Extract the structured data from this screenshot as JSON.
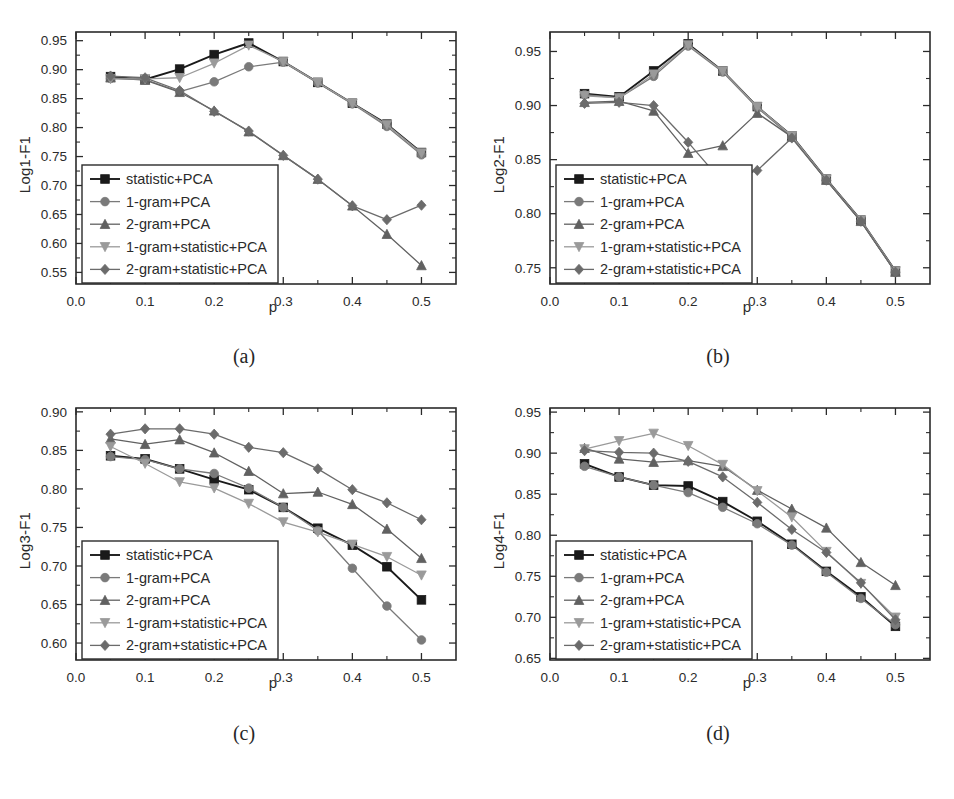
{
  "figure": {
    "panel_captions": [
      "(a)",
      "(b)",
      "(c)",
      "(d)"
    ],
    "x_axis_name": "p",
    "series_names": [
      "statistic+PCA",
      "1-gram+PCA",
      "2-gram+PCA",
      "1-gram+statistic+PCA",
      "2-gram+statistic+PCA"
    ],
    "series_markers": [
      "square",
      "circle",
      "triangle-up",
      "triangle-down",
      "diamond"
    ],
    "series_colors": [
      "#1a1a1a",
      "#7a7a7a",
      "#616161",
      "#9a9a9a",
      "#6b6b6b"
    ],
    "x_tick_labels": [
      "0.0",
      "0.1",
      "0.2",
      "0.3",
      "0.4",
      "0.5"
    ]
  },
  "chart_data": [
    {
      "type": "line",
      "panel": "(a)",
      "title": "",
      "xlabel": "p",
      "ylabel": "Log1-F1",
      "xlim": [
        0.0,
        0.55
      ],
      "ylim": [
        0.53,
        0.965
      ],
      "xticks": [
        0.0,
        0.1,
        0.2,
        0.3,
        0.4,
        0.5
      ],
      "yticks": [
        0.55,
        0.6,
        0.65,
        0.7,
        0.75,
        0.8,
        0.85,
        0.9,
        0.95
      ],
      "grid": false,
      "legend_position": "lower-left",
      "x": [
        0.05,
        0.1,
        0.15,
        0.2,
        0.25,
        0.3,
        0.35,
        0.4,
        0.45,
        0.5
      ],
      "series": [
        {
          "name": "statistic+PCA",
          "values": [
            0.888,
            0.883,
            0.901,
            0.926,
            0.946,
            0.914,
            0.878,
            0.842,
            0.806,
            0.757
          ]
        },
        {
          "name": "1-gram+PCA",
          "values": [
            0.885,
            0.883,
            0.862,
            0.879,
            0.905,
            0.913,
            0.877,
            0.841,
            0.802,
            0.753
          ]
        },
        {
          "name": "2-gram+PCA",
          "values": [
            0.886,
            0.882,
            0.861,
            0.829,
            0.793,
            0.752,
            0.711,
            0.665,
            0.616,
            0.562
          ]
        },
        {
          "name": "1-gram+statistic+PCA",
          "values": [
            0.884,
            0.884,
            0.886,
            0.911,
            0.942,
            0.914,
            0.878,
            0.842,
            0.805,
            0.756
          ]
        },
        {
          "name": "2-gram+statistic+PCA",
          "values": [
            0.889,
            0.886,
            0.864,
            0.828,
            0.794,
            0.752,
            0.711,
            0.665,
            0.641,
            0.666
          ]
        }
      ]
    },
    {
      "type": "line",
      "panel": "(b)",
      "title": "",
      "xlabel": "p",
      "ylabel": "Log2-F1",
      "xlim": [
        0.0,
        0.55
      ],
      "ylim": [
        0.735,
        0.968
      ],
      "xticks": [
        0.0,
        0.1,
        0.2,
        0.3,
        0.4,
        0.5
      ],
      "yticks": [
        0.75,
        0.8,
        0.85,
        0.9,
        0.95
      ],
      "grid": false,
      "legend_position": "lower-left",
      "x": [
        0.05,
        0.1,
        0.15,
        0.2,
        0.25,
        0.3,
        0.35,
        0.4,
        0.45,
        0.5
      ],
      "series": [
        {
          "name": "statistic+PCA",
          "values": [
            0.911,
            0.908,
            0.932,
            0.957,
            0.932,
            0.899,
            0.872,
            0.832,
            0.794,
            0.747
          ]
        },
        {
          "name": "1-gram+PCA",
          "values": [
            0.91,
            0.907,
            0.927,
            0.955,
            0.931,
            0.898,
            0.871,
            0.831,
            0.793,
            0.746
          ]
        },
        {
          "name": "2-gram+PCA",
          "values": [
            0.903,
            0.904,
            0.895,
            0.856,
            0.863,
            0.893,
            0.871,
            0.831,
            0.793,
            0.746
          ]
        },
        {
          "name": "1-gram+statistic+PCA",
          "values": [
            0.909,
            0.907,
            0.929,
            0.956,
            0.932,
            0.899,
            0.872,
            0.832,
            0.794,
            0.747
          ]
        },
        {
          "name": "2-gram+statistic+PCA",
          "values": [
            0.902,
            0.903,
            0.9,
            0.866,
            0.829,
            0.84,
            0.87,
            0.831,
            0.793,
            0.746
          ]
        }
      ]
    },
    {
      "type": "line",
      "panel": "(c)",
      "title": "",
      "xlabel": "p",
      "ylabel": "Log3-F1",
      "xlim": [
        0.0,
        0.55
      ],
      "ylim": [
        0.578,
        0.905
      ],
      "xticks": [
        0.0,
        0.1,
        0.2,
        0.3,
        0.4,
        0.5
      ],
      "yticks": [
        0.6,
        0.65,
        0.7,
        0.75,
        0.8,
        0.85,
        0.9
      ],
      "grid": false,
      "legend_position": "lower-left",
      "x": [
        0.05,
        0.1,
        0.15,
        0.2,
        0.25,
        0.3,
        0.35,
        0.4,
        0.45,
        0.5
      ],
      "series": [
        {
          "name": "statistic+PCA",
          "values": [
            0.843,
            0.839,
            0.826,
            0.812,
            0.799,
            0.776,
            0.749,
            0.727,
            0.699,
            0.656
          ]
        },
        {
          "name": "1-gram+PCA",
          "values": [
            0.842,
            0.838,
            0.826,
            0.82,
            0.801,
            0.776,
            0.746,
            0.697,
            0.648,
            0.604
          ]
        },
        {
          "name": "2-gram+PCA",
          "values": [
            0.865,
            0.858,
            0.864,
            0.847,
            0.823,
            0.794,
            0.796,
            0.78,
            0.748,
            0.71
          ]
        },
        {
          "name": "1-gram+statistic+PCA",
          "values": [
            0.855,
            0.833,
            0.809,
            0.801,
            0.781,
            0.757,
            0.744,
            0.728,
            0.712,
            0.688
          ]
        },
        {
          "name": "2-gram+statistic+PCA",
          "values": [
            0.871,
            0.878,
            0.878,
            0.871,
            0.854,
            0.847,
            0.826,
            0.799,
            0.782,
            0.76
          ]
        }
      ]
    },
    {
      "type": "line",
      "panel": "(d)",
      "title": "",
      "xlabel": "p",
      "ylabel": "Log4-F1",
      "xlim": [
        0.0,
        0.55
      ],
      "ylim": [
        0.648,
        0.955
      ],
      "xticks": [
        0.0,
        0.1,
        0.2,
        0.3,
        0.4,
        0.5
      ],
      "yticks": [
        0.65,
        0.7,
        0.75,
        0.8,
        0.85,
        0.9,
        0.95
      ],
      "grid": false,
      "legend_position": "lower-left",
      "x": [
        0.05,
        0.1,
        0.15,
        0.2,
        0.25,
        0.3,
        0.35,
        0.4,
        0.45,
        0.5
      ],
      "series": [
        {
          "name": "statistic+PCA",
          "values": [
            0.887,
            0.871,
            0.861,
            0.86,
            0.841,
            0.817,
            0.789,
            0.756,
            0.725,
            0.689
          ]
        },
        {
          "name": "1-gram+PCA",
          "values": [
            0.884,
            0.871,
            0.861,
            0.852,
            0.834,
            0.814,
            0.788,
            0.755,
            0.723,
            0.691
          ]
        },
        {
          "name": "2-gram+PCA",
          "values": [
            0.906,
            0.893,
            0.889,
            0.891,
            0.884,
            0.855,
            0.832,
            0.809,
            0.767,
            0.739
          ]
        },
        {
          "name": "1-gram+statistic+PCA",
          "values": [
            0.905,
            0.915,
            0.924,
            0.909,
            0.886,
            0.854,
            0.822,
            0.78,
            0.741,
            0.7
          ]
        },
        {
          "name": "2-gram+statistic+PCA",
          "values": [
            0.903,
            0.901,
            0.9,
            0.89,
            0.871,
            0.84,
            0.807,
            0.779,
            0.742,
            0.697
          ]
        }
      ]
    }
  ]
}
